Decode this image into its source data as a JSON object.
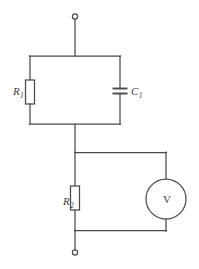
{
  "figure": {
    "name": "circuit-diagram",
    "background_color": "#ffffff",
    "line_color": "#4a4a4a",
    "text_color": "#3d3d3d"
  },
  "components": {
    "resistor_1": {
      "symbol": "R",
      "subscript": "1",
      "type": "resistor",
      "branch": "left-parallel-branch"
    },
    "capacitor_1": {
      "symbol": "C",
      "subscript": "1",
      "type": "capacitor",
      "branch": "right-parallel-branch"
    },
    "resistor_2": {
      "symbol": "R",
      "subscript": "2",
      "type": "resistor",
      "branch": "lower-left-branch"
    },
    "voltmeter": {
      "symbol": "V",
      "type": "voltmeter",
      "branch": "lower-right-branch"
    }
  },
  "terminals": {
    "top": "open-terminal-top",
    "bottom": "open-terminal-bottom"
  }
}
